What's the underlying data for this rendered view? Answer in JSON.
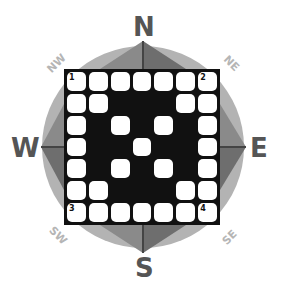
{
  "compass": {
    "north": "N",
    "south": "S",
    "east": "E",
    "west": "W",
    "northwest": "NW",
    "northeast": "NE",
    "southwest": "SW",
    "southeast": "SE",
    "colors": {
      "circle": "#b3b3b3",
      "arrow_light": "#a8a8a8",
      "arrow_dark": "#555555",
      "letter": "#555555"
    }
  },
  "puzzle": {
    "rows": 7,
    "cols": 7,
    "layout": [
      "WWWWWWW",
      "WWBBBWW",
      "WBWBWBW",
      "WBBWBBW",
      "WBWBWBW",
      "WWBBBWW",
      "WWWWWWW"
    ],
    "numbers": [
      {
        "row": 0,
        "col": 0,
        "label": "1"
      },
      {
        "row": 0,
        "col": 6,
        "label": "2"
      },
      {
        "row": 6,
        "col": 0,
        "label": "3"
      },
      {
        "row": 6,
        "col": 6,
        "label": "4"
      }
    ]
  }
}
